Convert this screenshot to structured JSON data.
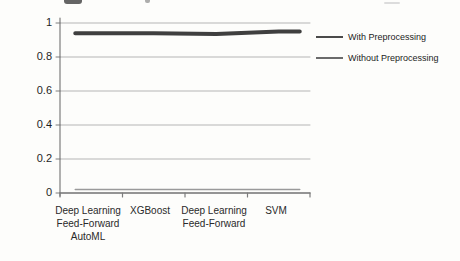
{
  "figure": {
    "background": "#fdfdfb"
  },
  "axis": {
    "y_ticks": [
      "1",
      "0.8",
      "0.6",
      "0.4",
      "0.2",
      "0"
    ]
  },
  "x_labels": [
    "Deep Learning\nFeed-Forward\nAutoML",
    "XGBoost",
    "Deep Learning\nFeed-Forward",
    "SVM"
  ],
  "colors": {
    "gridline": "#b5b5b5",
    "axis": "#7d7d7d",
    "series1": "#3f3f3f",
    "series2": "#9a9a9a",
    "legend_swatch1": "#4a4a4a",
    "legend_swatch2": "#6b6b6b",
    "text": "#262626"
  },
  "chart_data": {
    "type": "line",
    "categories": [
      "Deep Learning Feed-Forward AutoML",
      "XGBoost",
      "Deep Learning Feed-Forward",
      "SVM"
    ],
    "series": [
      {
        "name": "With Preprocessing",
        "values": [
          0.94,
          0.94,
          0.935,
          0.95
        ]
      },
      {
        "name": "Without Preprocessing",
        "values": [
          0.02,
          0.02,
          0.02,
          0.02
        ]
      }
    ],
    "title": "",
    "xlabel": "",
    "ylabel": "",
    "ylim": [
      0,
      1
    ],
    "yticks": [
      0,
      0.2,
      0.4,
      0.6,
      0.8,
      1
    ],
    "grid": true,
    "legend_position": "right"
  }
}
